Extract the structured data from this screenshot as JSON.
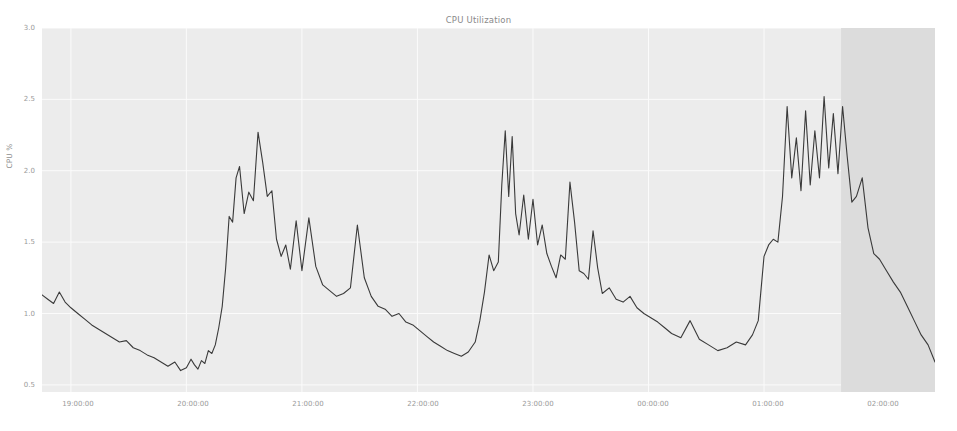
{
  "chart_data": {
    "type": "line",
    "title": "CPU Utilization",
    "xlabel": "",
    "ylabel": "CPU %",
    "ylim": [
      0.45,
      3.0
    ],
    "xlim": [
      "18:45:00",
      "02:30:00"
    ],
    "grid": true,
    "legend": null,
    "line_color": "#3a3a3a",
    "plot_bg_color": "#ececec",
    "grid_color": "#fbfbfb",
    "highlight_band": {
      "label": "forecast-region",
      "start": "01:40:00",
      "end": "02:30:00",
      "color": "#dcdcdc"
    },
    "ytick_labels": [
      "3.0",
      "2.5",
      "2.0",
      "1.5",
      "1.0",
      "0.5"
    ],
    "ytick_values": [
      3.0,
      2.5,
      2.0,
      1.5,
      1.0,
      0.5
    ],
    "xtick_labels": [
      "19:00:00",
      "20:00:00",
      "21:00:00",
      "22:00:00",
      "23:00:00",
      "00:00:00",
      "01:00:00",
      "02:00:00"
    ],
    "xtick_values": [
      19.0,
      20.0,
      21.0,
      22.0,
      23.0,
      24.0,
      25.0,
      26.0
    ],
    "series": [
      {
        "name": "CPU %",
        "x": [
          18.75,
          18.8,
          18.85,
          18.9,
          18.95,
          19.0,
          19.06,
          19.12,
          19.18,
          19.24,
          19.3,
          19.36,
          19.42,
          19.48,
          19.54,
          19.6,
          19.66,
          19.72,
          19.78,
          19.84,
          19.9,
          19.95,
          20.0,
          20.04,
          20.07,
          20.1,
          20.13,
          20.16,
          20.19,
          20.22,
          20.25,
          20.28,
          20.31,
          20.34,
          20.37,
          20.4,
          20.43,
          20.46,
          20.5,
          20.54,
          20.58,
          20.62,
          20.66,
          20.7,
          20.74,
          20.78,
          20.82,
          20.86,
          20.9,
          20.95,
          21.0,
          21.06,
          21.12,
          21.18,
          21.24,
          21.3,
          21.36,
          21.42,
          21.48,
          21.54,
          21.6,
          21.66,
          21.72,
          21.78,
          21.84,
          21.9,
          21.96,
          22.02,
          22.08,
          22.14,
          22.2,
          22.26,
          22.32,
          22.38,
          22.44,
          22.5,
          22.54,
          22.58,
          22.62,
          22.66,
          22.7,
          22.73,
          22.76,
          22.79,
          22.82,
          22.85,
          22.88,
          22.92,
          22.96,
          23.0,
          23.04,
          23.08,
          23.12,
          23.16,
          23.2,
          23.24,
          23.28,
          23.32,
          23.36,
          23.4,
          23.44,
          23.48,
          23.52,
          23.56,
          23.6,
          23.66,
          23.72,
          23.78,
          23.84,
          23.9,
          23.96,
          24.02,
          24.08,
          24.14,
          24.2,
          24.28,
          24.36,
          24.44,
          24.52,
          24.6,
          24.68,
          24.76,
          24.84,
          24.9,
          24.95,
          25.0,
          25.04,
          25.08,
          25.12,
          25.16,
          25.2,
          25.24,
          25.28,
          25.32,
          25.36,
          25.4,
          25.44,
          25.48,
          25.52,
          25.56,
          25.6,
          25.64,
          25.68,
          25.72,
          25.76,
          25.8,
          25.85,
          25.9,
          25.95,
          26.0,
          26.06,
          26.12,
          26.18,
          26.24,
          26.3,
          26.36,
          26.42,
          26.48
        ],
        "y": [
          1.13,
          1.1,
          1.07,
          1.15,
          1.08,
          1.04,
          1.0,
          0.96,
          0.92,
          0.89,
          0.86,
          0.83,
          0.8,
          0.81,
          0.76,
          0.74,
          0.71,
          0.69,
          0.66,
          0.63,
          0.66,
          0.6,
          0.62,
          0.68,
          0.64,
          0.61,
          0.67,
          0.65,
          0.74,
          0.72,
          0.78,
          0.9,
          1.05,
          1.32,
          1.68,
          1.64,
          1.95,
          2.03,
          1.7,
          1.85,
          1.79,
          2.27,
          2.06,
          1.82,
          1.86,
          1.52,
          1.4,
          1.48,
          1.31,
          1.65,
          1.3,
          1.67,
          1.33,
          1.2,
          1.16,
          1.12,
          1.14,
          1.18,
          1.62,
          1.25,
          1.12,
          1.05,
          1.03,
          0.98,
          1.0,
          0.94,
          0.92,
          0.88,
          0.84,
          0.8,
          0.77,
          0.74,
          0.72,
          0.7,
          0.73,
          0.8,
          0.95,
          1.15,
          1.41,
          1.3,
          1.36,
          1.9,
          2.28,
          1.82,
          2.24,
          1.7,
          1.55,
          1.83,
          1.52,
          1.8,
          1.48,
          1.62,
          1.42,
          1.33,
          1.25,
          1.41,
          1.38,
          1.92,
          1.64,
          1.3,
          1.28,
          1.24,
          1.58,
          1.32,
          1.14,
          1.18,
          1.1,
          1.08,
          1.12,
          1.04,
          1.0,
          0.97,
          0.94,
          0.9,
          0.86,
          0.83,
          0.95,
          0.82,
          0.78,
          0.74,
          0.76,
          0.8,
          0.78,
          0.85,
          0.95,
          1.4,
          1.48,
          1.52,
          1.5,
          1.82,
          2.45,
          1.95,
          2.23,
          1.86,
          2.42,
          1.9,
          2.28,
          1.95,
          2.52,
          2.02,
          2.4,
          1.98,
          2.45,
          2.1,
          1.78,
          1.82,
          1.95,
          1.6,
          1.42,
          1.38,
          1.3,
          1.22,
          1.15,
          1.05,
          0.95,
          0.85,
          0.78,
          0.66
        ]
      }
    ]
  },
  "axes": {
    "ytick_0": "3.0",
    "ytick_1": "2.5",
    "ytick_2": "2.0",
    "ytick_3": "1.5",
    "ytick_4": "1.0",
    "ytick_5": "0.5",
    "xtick_0": "19:00:00",
    "xtick_1": "20:00:00",
    "xtick_2": "21:00:00",
    "xtick_3": "22:00:00",
    "xtick_4": "23:00:00",
    "xtick_5": "00:00:00",
    "xtick_6": "01:00:00",
    "xtick_7": "02:00:00"
  }
}
